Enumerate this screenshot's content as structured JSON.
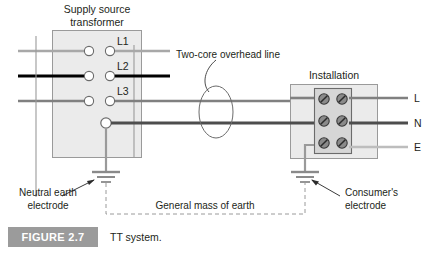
{
  "figure": {
    "caption_number": "FIGURE 2.7",
    "caption_text": "TT system.",
    "caption_badge_color": "#9b9b9b"
  },
  "labels": {
    "supply_source_line1": "Supply source",
    "supply_source_line2": "transformer",
    "installation": "Installation",
    "two_core": "Two-core overhead line",
    "general_mass": "General mass of earth",
    "neutral_electrode_line1": "Neutral earth",
    "neutral_electrode_line2": "electrode",
    "consumer_electrode_line1": "Consumer's",
    "consumer_electrode_line2": "electrode"
  },
  "phases": [
    {
      "id": "L1",
      "label": "L1",
      "color": "#a8a8a8",
      "y": 51
    },
    {
      "id": "L2",
      "label": "L2",
      "color": "#000000",
      "y": 76
    },
    {
      "id": "L3",
      "label": "L3",
      "color": "#808080",
      "y": 101
    }
  ],
  "neutral_terminal": {
    "id": "N0",
    "color": "#808080",
    "y": 123
  },
  "output_terminals": [
    {
      "id": "L",
      "label": "L",
      "color": "#808080",
      "y": 98
    },
    {
      "id": "N",
      "label": "N",
      "color": "#4d4d4d",
      "y": 123
    },
    {
      "id": "E",
      "label": "E",
      "color": "#bdbdbd",
      "y": 147
    }
  ],
  "boxes": {
    "transformer": {
      "fill": "#ebebeb",
      "stroke": "#9a9a9a",
      "x": 52,
      "y": 30,
      "w": 90,
      "h": 128
    },
    "installation": {
      "fill": "#ebebeb",
      "stroke": "#9a9a9a",
      "x": 290,
      "y": 84,
      "w": 88,
      "h": 75
    },
    "terminal_block": {
      "fill": "#d6d6d6",
      "stroke": "#6b6b6b",
      "x": 314,
      "y": 88,
      "w": 38,
      "h": 66
    }
  },
  "screws": {
    "count": 6,
    "rows": 3,
    "cols": 2,
    "fill": "#8a8a8a",
    "stroke": "#3a3a3a"
  },
  "earth": {
    "neutral_electrode_x": 106,
    "consumer_electrode_x": 305,
    "symbol_top_y": 163,
    "ground_color": "#8a8a8a",
    "dashed_color": "#9a9a9a"
  },
  "colors": {
    "text": "#231f20",
    "wire_light": "#a8a8a8",
    "wire_mid": "#808080",
    "wire_dark": "#000000",
    "box_fill": "#ebebeb",
    "box_stroke": "#9a9a9a"
  }
}
